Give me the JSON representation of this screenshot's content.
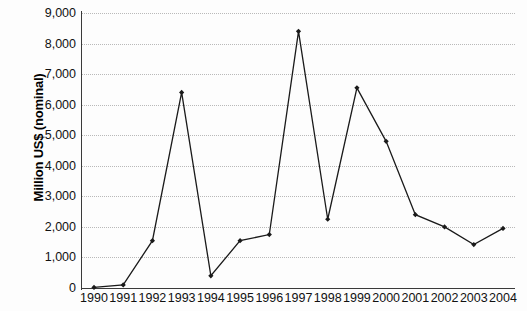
{
  "chart_data": {
    "type": "line",
    "title": "",
    "xlabel": "",
    "ylabel": "Million US$ (nominal)",
    "categories": [
      "1990",
      "1991",
      "1992",
      "1993",
      "1994",
      "1995",
      "1996",
      "1997",
      "1998",
      "1999",
      "2000",
      "2001",
      "2002",
      "2003",
      "2004"
    ],
    "values": [
      20,
      100,
      1550,
      6400,
      400,
      1550,
      1750,
      8400,
      2250,
      6550,
      4800,
      2400,
      2000,
      1420,
      1950
    ],
    "series": [
      {
        "name": "Million US$ (nominal)",
        "values": [
          20,
          100,
          1550,
          6400,
          400,
          1550,
          1750,
          8400,
          2250,
          6550,
          4800,
          2400,
          2000,
          1420,
          1950
        ]
      }
    ],
    "ylim": [
      0,
      9000
    ],
    "ytick_values": [
      0,
      1000,
      2000,
      3000,
      4000,
      5000,
      6000,
      7000,
      8000,
      9000
    ],
    "ytick_labels": [
      "0",
      "1,000",
      "2,000",
      "3,000",
      "4,000",
      "5,000",
      "6,000",
      "7,000",
      "8,000",
      "9,000"
    ],
    "grid": true,
    "grid_orientation": "horizontal",
    "grid_style": "dotted",
    "legend": false,
    "legend_position": "none",
    "marker": "diamond",
    "line_color": "#1a1a1a",
    "marker_color": "#1a1a1a",
    "grid_color": "#b9b9b9",
    "axis_color": "#3a3a3a",
    "background_color": "#fdfdfd"
  }
}
